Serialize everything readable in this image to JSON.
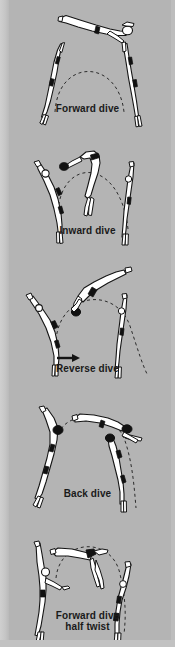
{
  "figure": {
    "background_color": "#b4b4b4",
    "ink_color": "#1a1a1a",
    "body_fill": "#ffffff",
    "trunks_color": "#111111",
    "trajectory_style": "dashed arc"
  },
  "panels": [
    {
      "id": "forward-dive",
      "caption": "Forward dive",
      "caption_line2": "",
      "poses": 3,
      "has_direction_arrow": false,
      "description": "Diver leaves board facing forward, arcs over head-first entry"
    },
    {
      "id": "inward-dive",
      "caption": "Inward dive",
      "caption_line2": "",
      "poses": 3,
      "has_direction_arrow": false,
      "description": "Diver stands backward on board, rotates inward toward the board"
    },
    {
      "id": "reverse-dive",
      "caption": "Reverse dive",
      "caption_line2": "",
      "poses": 3,
      "has_direction_arrow": true,
      "description": "Diver faces forward then rotates back toward the board"
    },
    {
      "id": "back-dive",
      "caption": "Back dive",
      "caption_line2": "",
      "poses": 3,
      "has_direction_arrow": false,
      "description": "Diver stands backward and rotates away from the board"
    },
    {
      "id": "forward-dive-half-twist",
      "caption": "Forward dive",
      "caption_line2": "half twist",
      "poses": 3,
      "has_direction_arrow": false,
      "description": "Forward dive with a half rotation about the long axis"
    }
  ]
}
